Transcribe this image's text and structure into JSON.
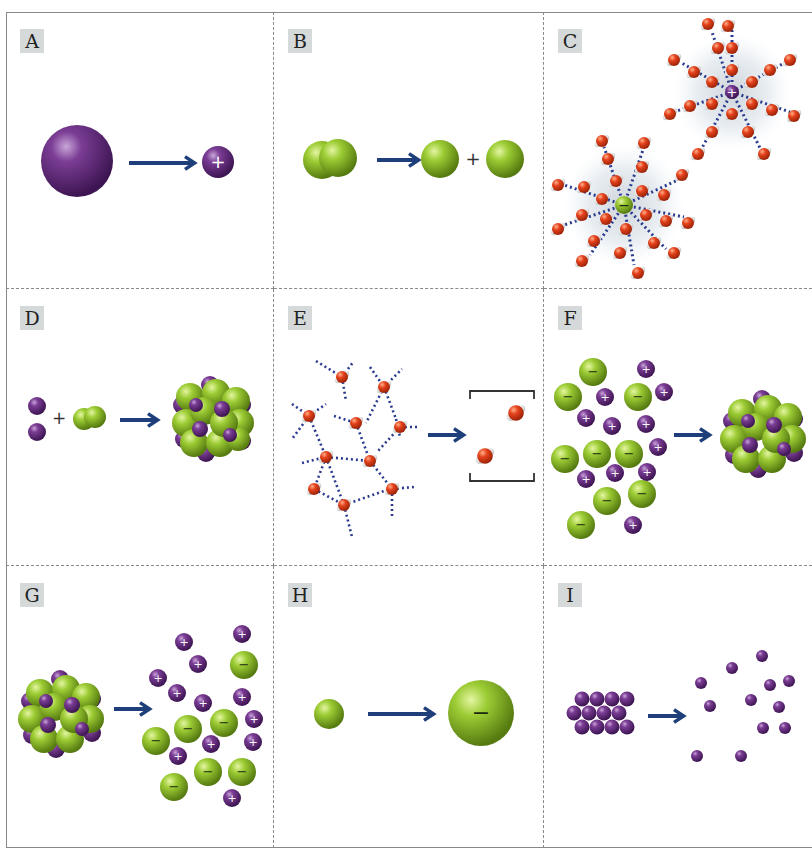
{
  "figure": {
    "panels": [
      {
        "id": "A",
        "label": "A",
        "description": "Large neutral atom forms smaller positive ion (cation)",
        "ion_charge": "+"
      },
      {
        "id": "B",
        "label": "B",
        "description": "Diatomic molecule splits into two atoms",
        "plus_sign": "+"
      },
      {
        "id": "C",
        "label": "C",
        "description": "Hydrated anion and cation surrounded by water molecules",
        "ion_charges": [
          "−",
          "+"
        ]
      },
      {
        "id": "D",
        "label": "D",
        "description": "Metal atoms plus diatomic molecule form ionic lattice",
        "plus_sign": "+"
      },
      {
        "id": "E",
        "label": "E",
        "description": "Hydrogen-bonded water network becomes separate water molecules"
      },
      {
        "id": "F",
        "label": "F",
        "description": "Separate ions combine into ionic crystal lattice",
        "ion_charges": [
          "−",
          "+"
        ]
      },
      {
        "id": "G",
        "label": "G",
        "description": "Ionic crystal lattice dissociates into separate ions",
        "ion_charges": [
          "−",
          "+"
        ]
      },
      {
        "id": "H",
        "label": "H",
        "description": "Small neutral atom forms larger negative ion (anion)",
        "ion_charge": "−"
      },
      {
        "id": "I",
        "label": "I",
        "description": "Solid metal atoms separate into gaseous atoms"
      }
    ],
    "colors": {
      "cation_purple": "#6b2f86",
      "anion_green": "#8dbb2c",
      "arrow_navy": "#1f3f7a",
      "water_red": "#e0401e",
      "label_bg": "#d5d9da",
      "divider": "#8a8a8a"
    }
  }
}
